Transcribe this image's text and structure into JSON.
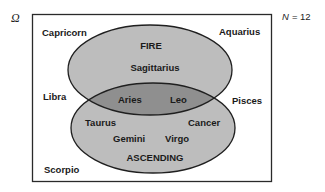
{
  "diagram": {
    "type": "venn",
    "universe_symbol": "Ω",
    "count_label": "N",
    "count_value": "= 12",
    "colors": {
      "background": "#ffffff",
      "box_stroke": "#2a2a2a",
      "set_fill": "#bdbdbd",
      "intersection_fill": "#8f8f8f",
      "ellipse_stroke": "#1f1f1f",
      "text": "#1a1a1a"
    },
    "sets": [
      {
        "name": "FIRE",
        "only_members": [
          "Sagittarius"
        ]
      },
      {
        "name": "ASCENDING",
        "only_members": [
          "Taurus",
          "Cancer",
          "Gemini",
          "Virgo"
        ]
      }
    ],
    "intersection": {
      "members": [
        "Aries",
        "Leo"
      ]
    },
    "outside": {
      "members": [
        "Capricorn",
        "Aquarius",
        "Libra",
        "Pisces",
        "Scorpio"
      ]
    }
  },
  "labels": {
    "fire": "FIRE",
    "ascending": "ASCENDING",
    "sagittarius": "Sagittarius",
    "aries": "Aries",
    "leo": "Leo",
    "taurus": "Taurus",
    "cancer": "Cancer",
    "gemini": "Gemini",
    "virgo": "Virgo",
    "capricorn": "Capricorn",
    "aquarius": "Aquarius",
    "libra": "Libra",
    "pisces": "Pisces",
    "scorpio": "Scorpio"
  }
}
